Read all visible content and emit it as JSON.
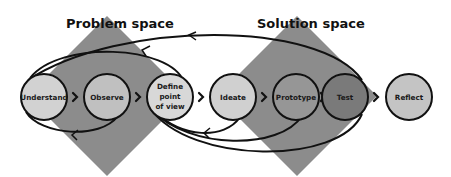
{
  "diagram": {
    "spaces": [
      {
        "id": "problem",
        "label": "Problem space",
        "color": "#8c8c8c",
        "cx": 107,
        "cy": 96,
        "half": 80
      },
      {
        "id": "solution",
        "label": "Solution space",
        "color": "#8c8c8c",
        "cx": 297,
        "cy": 96,
        "half": 80
      }
    ],
    "nodes": [
      {
        "id": "understand",
        "lines": [
          "Understand"
        ],
        "cx": 44,
        "cy": 97,
        "r": 23,
        "fill": "#d2d2d2"
      },
      {
        "id": "observe",
        "lines": [
          "Observe"
        ],
        "cx": 107,
        "cy": 97,
        "r": 23,
        "fill": "#c0c0c0"
      },
      {
        "id": "define",
        "lines": [
          "Define",
          "point",
          "of view"
        ],
        "cx": 170,
        "cy": 97,
        "r": 23,
        "fill": "#d8d8d8"
      },
      {
        "id": "ideate",
        "lines": [
          "Ideate"
        ],
        "cx": 233,
        "cy": 97,
        "r": 23,
        "fill": "#d0d0d0"
      },
      {
        "id": "prototype",
        "lines": [
          "Prototype"
        ],
        "cx": 296,
        "cy": 97,
        "r": 23,
        "fill": "#969696"
      },
      {
        "id": "test",
        "lines": [
          "Test"
        ],
        "cx": 345,
        "cy": 97,
        "r": 23,
        "fill": "#7a7a7a"
      },
      {
        "id": "reflect",
        "lines": [
          "Reflect"
        ],
        "cx": 409,
        "cy": 97,
        "r": 23,
        "fill": "#c4c4c4"
      }
    ],
    "connectors": [
      {
        "from": "understand",
        "to": "observe",
        "glyph": "›"
      },
      {
        "from": "observe",
        "to": "define",
        "glyph": "›"
      },
      {
        "from": "define",
        "to": "ideate",
        "glyph": "›"
      },
      {
        "from": "ideate",
        "to": "prototype",
        "glyph": "›"
      },
      {
        "from": "prototype",
        "to": "test",
        "glyph": "›"
      },
      {
        "from": "test",
        "to": "reflect",
        "glyph": "›"
      }
    ],
    "feedback_loops": [
      {
        "from": "test",
        "to": "understand",
        "position": "top",
        "label": ""
      },
      {
        "from": "define",
        "to": "understand",
        "position": "top",
        "label": ""
      },
      {
        "from": "observe",
        "to": "understand",
        "position": "bottom",
        "label": ""
      },
      {
        "from": "ideate",
        "to": "define",
        "position": "bottom",
        "label": ""
      },
      {
        "from": "prototype",
        "to": "define",
        "position": "bottom",
        "label": ""
      },
      {
        "from": "test",
        "to": "define",
        "position": "bottom",
        "label": ""
      }
    ],
    "colors": {
      "outline": "#111111",
      "diamond": "#8c8c8c",
      "background": "#ffffff"
    }
  }
}
